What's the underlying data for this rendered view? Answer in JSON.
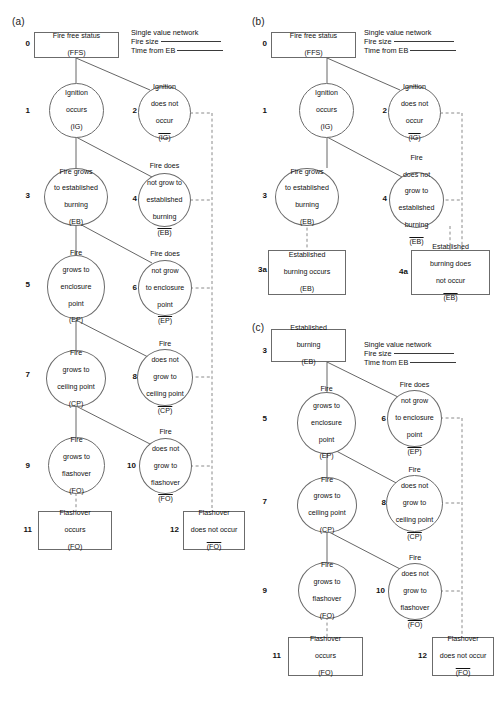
{
  "figure": {
    "panels": [
      {
        "id": "a",
        "label": "(a)",
        "legend": {
          "title": "Single value network",
          "row1_label": "Fire size",
          "row2_label": "Time from EB"
        },
        "nodes": [
          {
            "key": "a0",
            "idx": "0",
            "shape": "rect",
            "lines": [
              "Fire free status",
              "(FFS)"
            ]
          },
          {
            "key": "a1",
            "idx": "1",
            "shape": "circle",
            "lines": [
              "Ignition",
              "occurs",
              "(IG)"
            ]
          },
          {
            "key": "a2",
            "idx": "2",
            "shape": "circle",
            "lines": [
              "Ignition",
              "does not",
              "occur",
              "(IG)"
            ],
            "overline_last": true
          },
          {
            "key": "a3",
            "idx": "3",
            "shape": "circle",
            "lines": [
              "Fire grows",
              "to established",
              "burning",
              "(EB)"
            ]
          },
          {
            "key": "a4",
            "idx": "4",
            "shape": "circle",
            "lines": [
              "Fire does",
              "not grow to",
              "established",
              "burning",
              "(EB)"
            ],
            "overline_last": true
          },
          {
            "key": "a5",
            "idx": "5",
            "shape": "circle",
            "lines": [
              "Fire",
              "grows to",
              "enclosure",
              "point",
              "(EP)"
            ]
          },
          {
            "key": "a6",
            "idx": "6",
            "shape": "circle",
            "lines": [
              "Fire does",
              "not grow",
              "to enclosure",
              "point",
              "(EP)"
            ],
            "overline_last": true
          },
          {
            "key": "a7",
            "idx": "7",
            "shape": "circle",
            "lines": [
              "Fire",
              "grows to",
              "ceiling point",
              "(CP)"
            ]
          },
          {
            "key": "a8",
            "idx": "8",
            "shape": "circle",
            "lines": [
              "Fire",
              "does not",
              "grow to",
              "ceiling point",
              "(CP)"
            ],
            "overline_last": true
          },
          {
            "key": "a9",
            "idx": "9",
            "shape": "circle",
            "lines": [
              "Fire",
              "grows to",
              "flashover",
              "(FO)"
            ]
          },
          {
            "key": "a10",
            "idx": "10",
            "shape": "circle",
            "lines": [
              "Fire",
              "does not",
              "grow to",
              "flashover",
              "(FO)"
            ],
            "overline_last": true
          },
          {
            "key": "a11",
            "idx": "11",
            "shape": "rect",
            "lines": [
              "Flashover",
              "occurs",
              "(FO)"
            ]
          },
          {
            "key": "a12",
            "idx": "12",
            "shape": "rect",
            "lines": [
              "Flashover",
              "does not occur",
              "(FO)"
            ],
            "overline_last": true
          }
        ]
      },
      {
        "id": "b",
        "label": "(b)",
        "legend": {
          "title": "Single value network",
          "row1_label": "Fire size",
          "row2_label": "Time from EB"
        },
        "nodes": [
          {
            "key": "b0",
            "idx": "0",
            "shape": "rect",
            "lines": [
              "Fire free status",
              "(FFS)"
            ]
          },
          {
            "key": "b1",
            "idx": "1",
            "shape": "circle",
            "lines": [
              "Ignition",
              "occurs",
              "(IG)"
            ]
          },
          {
            "key": "b2",
            "idx": "2",
            "shape": "circle",
            "lines": [
              "Ignition",
              "does not",
              "occur",
              "(IG)"
            ],
            "overline_last": true
          },
          {
            "key": "b3",
            "idx": "3",
            "shape": "circle",
            "lines": [
              "Fire grows",
              "to established",
              "burning",
              "(EB)"
            ]
          },
          {
            "key": "b4",
            "idx": "4",
            "shape": "circle",
            "lines": [
              "Fire",
              "does not",
              "grow to",
              "established",
              "burning",
              "(EB)"
            ],
            "overline_last": true
          },
          {
            "key": "b3a",
            "idx": "3a",
            "shape": "rect",
            "lines": [
              "Established",
              "burning occurs",
              "(EB)"
            ]
          },
          {
            "key": "b4a",
            "idx": "4a",
            "shape": "rect",
            "lines": [
              "Established",
              "burning does",
              "not occur",
              "(EB)"
            ],
            "overline_last": true
          }
        ]
      },
      {
        "id": "c",
        "label": "(c)",
        "legend": {
          "title": "Single value network",
          "row1_label": "Fire size",
          "row2_label": "Time from EB"
        },
        "nodes": [
          {
            "key": "c3",
            "idx": "3",
            "shape": "rect",
            "lines": [
              "Established",
              "burning",
              "(EB)"
            ]
          },
          {
            "key": "c5",
            "idx": "5",
            "shape": "circle",
            "lines": [
              "Fire",
              "grows to",
              "enclosure",
              "point",
              "(EP)"
            ]
          },
          {
            "key": "c6",
            "idx": "6",
            "shape": "circle",
            "lines": [
              "Fire does",
              "not grow",
              "to enclosure",
              "point",
              "(EP)"
            ],
            "overline_last": true
          },
          {
            "key": "c7",
            "idx": "7",
            "shape": "circle",
            "lines": [
              "Fire",
              "grows to",
              "ceiling point",
              "(CP)"
            ]
          },
          {
            "key": "c8",
            "idx": "8",
            "shape": "circle",
            "lines": [
              "Fire",
              "does not",
              "grow to",
              "ceiling point",
              "(CP)"
            ],
            "overline_last": true
          },
          {
            "key": "c9",
            "idx": "9",
            "shape": "circle",
            "lines": [
              "Fire",
              "grows to",
              "flashover",
              "(FO)"
            ]
          },
          {
            "key": "c10",
            "idx": "10",
            "shape": "circle",
            "lines": [
              "Fire",
              "does not",
              "grow to",
              "flashover",
              "(FO)"
            ],
            "overline_last": true
          },
          {
            "key": "c11",
            "idx": "11",
            "shape": "rect",
            "lines": [
              "Flashover",
              "occurs",
              "(FO)"
            ]
          },
          {
            "key": "c12",
            "idx": "12",
            "shape": "rect",
            "lines": [
              "Flashover",
              "does not occur",
              "(FO)"
            ],
            "overline_last": true
          }
        ]
      }
    ],
    "colors": {
      "stroke": "#6b6b6b",
      "line": "#4d4d4d",
      "dashed": "#9a9a9a",
      "text": "#111111",
      "background": "#ffffff"
    }
  }
}
